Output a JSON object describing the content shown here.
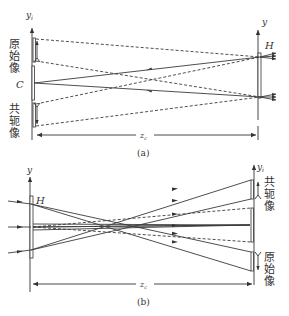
{
  "figure": {
    "panel_a": {
      "caption": "(a)",
      "left_axis_label": "y",
      "left_axis_subscript": "i",
      "right_axis_label": "y",
      "hologram_label": "H",
      "center_label": "C",
      "original_image_label": [
        "原",
        "始",
        "像"
      ],
      "conjugate_image_label": [
        "共",
        "轭",
        "像"
      ],
      "distance_label": "z",
      "distance_subscript": "c"
    },
    "panel_b": {
      "caption": "(b)",
      "left_axis_label": "y",
      "hologram_label": "H",
      "right_axis_label": "y",
      "right_axis_subscript": "i",
      "conjugate_image_label": [
        "共",
        "轭",
        "像"
      ],
      "original_image_label": [
        "原",
        "始",
        "像"
      ],
      "distance_label": "z",
      "distance_subscript": "c"
    },
    "colors": {
      "line": "#3a3a3a",
      "background": "#ffffff"
    }
  }
}
